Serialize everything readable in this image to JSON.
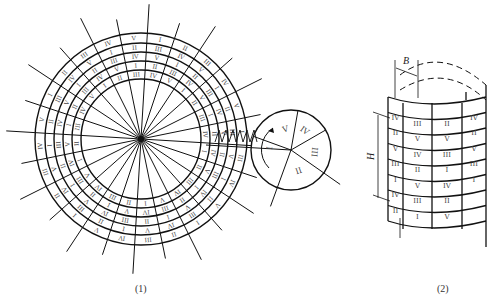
{
  "figure": {
    "panel1": {
      "caption": "(1)",
      "center": [
        141,
        139
      ],
      "radii": [
        60,
        69,
        78,
        87,
        96,
        106
      ],
      "spoke_count": 24,
      "band_label_sequences": [
        [
          "III",
          "V",
          "II",
          "IV",
          "I"
        ],
        [
          "IV",
          "I",
          "III",
          "V",
          "II"
        ],
        [
          "V",
          "II",
          "IV",
          "I",
          "III"
        ],
        [
          "I",
          "III",
          "V",
          "II",
          "IV"
        ],
        [
          "II",
          "IV",
          "I",
          "III",
          "V"
        ]
      ],
      "small_disk": {
        "center": [
          291,
          150
        ],
        "radius": 40,
        "sectors": [
          "I",
          "V",
          "IV",
          "III",
          "II"
        ]
      }
    },
    "panel2": {
      "caption": "(2)",
      "dimension_labels": {
        "width": "B",
        "height": "H"
      },
      "rows": [
        [
          "IV",
          "III",
          "II",
          "IV"
        ],
        [
          "II",
          "V",
          "V",
          "II"
        ],
        [
          "V",
          "IV",
          "III",
          "V"
        ],
        [
          "III",
          "II",
          "I",
          "III"
        ],
        [
          "I",
          "V",
          "IV",
          "I"
        ],
        [
          "IV",
          "III",
          "II",
          ""
        ],
        [
          "II",
          "I",
          "V",
          ""
        ]
      ]
    }
  },
  "colors": {
    "line": "#111111",
    "label": "#444444",
    "background": "#ffffff"
  }
}
